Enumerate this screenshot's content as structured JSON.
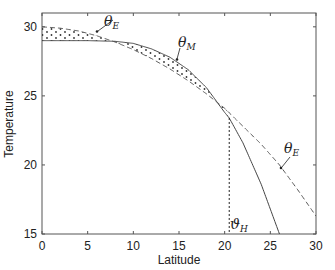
{
  "chart_data": {
    "type": "line",
    "title": "",
    "xlabel": "Latitude",
    "ylabel": "Temperature",
    "xlim": [
      0,
      30
    ],
    "ylim": [
      15,
      31
    ],
    "xticks": [
      0,
      5,
      10,
      15,
      20,
      25,
      30
    ],
    "yticks": [
      15,
      20,
      25,
      30
    ],
    "grid": false,
    "legend": null,
    "series": [
      {
        "name": "theta_M",
        "style": "solid",
        "x": [
          0,
          5,
          8,
          10,
          12,
          14,
          16,
          18,
          20,
          20.5,
          22,
          24,
          26
        ],
        "y": [
          29,
          29,
          28.95,
          28.8,
          28.4,
          27.8,
          26.9,
          25.6,
          23.8,
          23.4,
          21.6,
          18.6,
          15
        ]
      },
      {
        "name": "theta_E",
        "style": "dashed",
        "x": [
          0,
          2,
          4,
          6,
          8,
          10,
          12,
          14,
          16,
          18,
          20,
          22,
          24,
          26,
          28,
          30
        ],
        "y": [
          30,
          29.9,
          29.7,
          29.35,
          28.9,
          28.35,
          27.7,
          26.95,
          26.1,
          25.15,
          24.1,
          22.8,
          21.5,
          20,
          18.2,
          16.3
        ]
      }
    ],
    "shaded_region": {
      "pattern": "dots",
      "description": "between theta_E and theta_M where theta_E > theta_M (0 to ~9) and where theta_M > theta_E (~10 to 20.5)"
    },
    "vertical_line": {
      "x": 20.5,
      "style": "dotted",
      "label": "ϑH"
    },
    "annotations": [
      {
        "text": "θE",
        "x": 6,
        "y": 29.5,
        "target": "theta_E"
      },
      {
        "text": "θM",
        "x": 14.8,
        "y": 27.6,
        "target": "theta_M"
      },
      {
        "text": "θE",
        "x": 25.5,
        "y": 20,
        "target": "theta_E"
      },
      {
        "text": "ϑH",
        "x": 20.5,
        "y": 15.3
      }
    ]
  },
  "labels": {
    "xlabel": "Latitude",
    "ylabel": "Temperature",
    "xticks": [
      "0",
      "5",
      "10",
      "15",
      "20",
      "25",
      "30"
    ],
    "yticks": [
      "15",
      "20",
      "25",
      "30"
    ],
    "theta_e_1": "θ",
    "theta_e_1_sub": "E",
    "theta_m": "θ",
    "theta_m_sub": "M",
    "theta_e_2": "θ",
    "theta_e_2_sub": "E",
    "theta_h": "ϑ",
    "theta_h_sub": "H"
  }
}
